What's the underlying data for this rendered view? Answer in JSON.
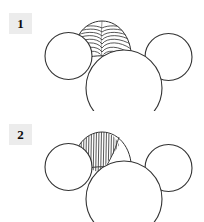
{
  "figure": {
    "width": 204,
    "height": 222,
    "background_color": "#ffffff",
    "stroke_color": "#333333",
    "hatch_color": "#3a3a3a",
    "label_box_color": "#ececec",
    "label_text_color": "#0b0b0b",
    "panels": [
      {
        "id": "panel-1",
        "label": "1",
        "hatch_orientation": "horizontal",
        "description": "Cluster of four outlined circles with a curved horizontal hatched fan region between the two upper circles"
      },
      {
        "id": "panel-2",
        "label": "2",
        "hatch_orientation": "vertical",
        "description": "Cluster of four outlined circles with a vertically hatched fan region on the left upper lobe"
      }
    ]
  }
}
